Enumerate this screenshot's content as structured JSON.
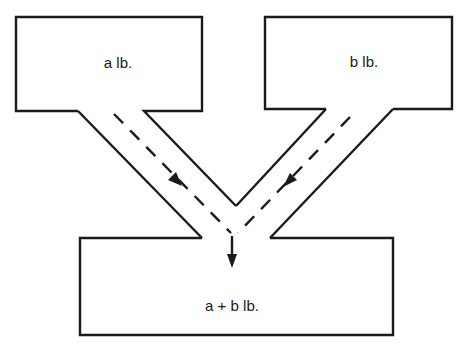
{
  "diagram": {
    "type": "mass-balance mixing diagram",
    "colors": {
      "stroke": "#1a1a1a",
      "background": "#ffffff"
    },
    "nodes": [
      {
        "id": "input-a",
        "label": "a lb.",
        "position": "top-left"
      },
      {
        "id": "input-b",
        "label": "b lb.",
        "position": "top-right"
      },
      {
        "id": "output",
        "label": "a + b lb.",
        "position": "bottom"
      }
    ],
    "edges": [
      {
        "from": "input-a",
        "to": "output",
        "style": "dashed-arrow"
      },
      {
        "from": "input-b",
        "to": "output",
        "style": "dashed-arrow"
      }
    ]
  }
}
